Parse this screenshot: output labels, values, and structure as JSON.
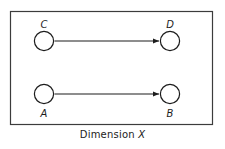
{
  "figure": {
    "name": "dimension-x-diagram",
    "background_color": "#ffffff",
    "border_color": "#3c3c3c",
    "stroke_color": "#1c1c1c",
    "frame": {
      "x": 10,
      "y": 11,
      "width": 203,
      "height": 114
    },
    "caption": {
      "text_prefix": "Dimension ",
      "variable": "X",
      "full_text": "Dimension X"
    },
    "nodes": [
      {
        "id": "C",
        "label": "C",
        "cx": 44,
        "cy": 41,
        "r": 10,
        "label_x": 44,
        "label_y": 25,
        "label_position": "above"
      },
      {
        "id": "D",
        "label": "D",
        "cx": 170,
        "cy": 41,
        "r": 10,
        "label_x": 170,
        "label_y": 25,
        "label_position": "above"
      },
      {
        "id": "A",
        "label": "A",
        "cx": 44,
        "cy": 94,
        "r": 10,
        "label_x": 44,
        "label_y": 117,
        "label_position": "below"
      },
      {
        "id": "B",
        "label": "B",
        "cx": 170,
        "cy": 94,
        "r": 10,
        "label_x": 170,
        "label_y": 117,
        "label_position": "below"
      }
    ],
    "connectors": [
      {
        "id": "C-D",
        "from": "C",
        "to": "D",
        "x1": 55,
        "x2": 159,
        "y": 41,
        "arrowheads": "both",
        "style": "double-headed-arrow"
      },
      {
        "id": "A-B",
        "from": "A",
        "to": "B",
        "x1": 55,
        "x2": 159,
        "y": 94,
        "arrowheads": "both",
        "style": "double-headed-arrow"
      }
    ]
  }
}
